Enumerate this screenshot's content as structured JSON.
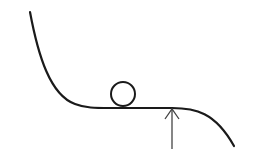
{
  "diagram": {
    "colors": {
      "curve": "#1a1a1a",
      "ball": "#1a1a1a",
      "arrow": "#444444",
      "background": "#ffffff"
    },
    "elements": {
      "curve": "potential-curve",
      "ball": "ball",
      "arrow": "marker-arrow"
    }
  }
}
